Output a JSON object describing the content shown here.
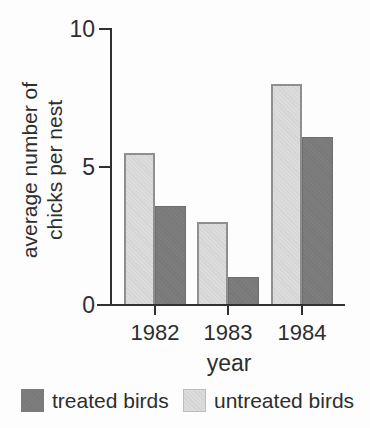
{
  "figure": {
    "background": "#fdfdfd",
    "text_color": "#2e2e2e",
    "axis_color": "#303030"
  },
  "chart_data": {
    "type": "bar",
    "title": "",
    "categories": [
      "1982",
      "1983",
      "1984"
    ],
    "series": [
      {
        "name": "untreated birds",
        "color": "#dcdcdc",
        "border_color": "#8f8f8f",
        "values": [
          5.5,
          3.0,
          8.0
        ]
      },
      {
        "name": "treated birds",
        "color": "#7d7d7d",
        "border_color": "#6e6e6e",
        "values": [
          3.6,
          1.0,
          6.1
        ]
      }
    ],
    "xlabel": "year",
    "ylabel": "average number of chicks per nest",
    "ylabel_lines": [
      "average number of",
      "chicks per nest"
    ],
    "ylim": [
      0,
      10
    ],
    "yticks": [
      0,
      5,
      10
    ],
    "grid": false,
    "legend_position": "bottom"
  },
  "axis": {
    "ylabel_line1": "average number of",
    "ylabel_line2": "chicks per nest",
    "xlabel": "year"
  },
  "legend": {
    "items": [
      {
        "label": "treated birds",
        "color": "#7d7d7d",
        "swatch": "dark"
      },
      {
        "label": "untreated birds",
        "color": "#dcdcdc",
        "swatch": "light"
      }
    ]
  }
}
